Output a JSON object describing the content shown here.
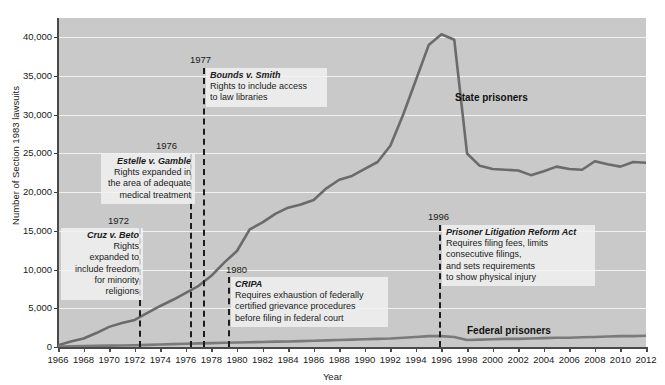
{
  "chart_data": {
    "type": "line",
    "title": "",
    "xlabel": "Year",
    "ylabel": "Number of Section 1983 lawsuits",
    "xlim": [
      1966,
      2012
    ],
    "ylim": [
      0,
      42500
    ],
    "grid": true,
    "legend_position": "inline-annotations",
    "y_ticks": [
      0,
      5000,
      10000,
      15000,
      20000,
      25000,
      30000,
      35000,
      40000
    ],
    "y_tick_labels": [
      "0",
      "5,000",
      "10,000",
      "15,000",
      "20,000",
      "25,000",
      "30,000",
      "35,000",
      "40,000"
    ],
    "x_ticks": [
      1966,
      1968,
      1970,
      1972,
      1974,
      1976,
      1978,
      1980,
      1982,
      1984,
      1986,
      1988,
      1990,
      1992,
      1994,
      1996,
      1998,
      2000,
      2002,
      2004,
      2006,
      2008,
      2010,
      2012
    ],
    "x_tick_labels": [
      "1966",
      "1968",
      "1970",
      "1972",
      "1974",
      "1976",
      "1978",
      "1980",
      "1982",
      "1984",
      "1986",
      "1988",
      "1990",
      "1992",
      "1994",
      "1996",
      "1998",
      "2000",
      "2002",
      "2004",
      "2006",
      "2008",
      "2010",
      "2012"
    ],
    "x": [
      1966,
      1967,
      1968,
      1969,
      1970,
      1971,
      1972,
      1973,
      1974,
      1975,
      1976,
      1977,
      1978,
      1979,
      1980,
      1981,
      1982,
      1983,
      1984,
      1985,
      1986,
      1987,
      1988,
      1989,
      1990,
      1991,
      1992,
      1993,
      1994,
      1995,
      1996,
      1997,
      1998,
      1999,
      2000,
      2001,
      2002,
      2003,
      2004,
      2005,
      2006,
      2007,
      2008,
      2009,
      2010,
      2011,
      2012
    ],
    "series": [
      {
        "name": "State prisoners",
        "color": "#6b6b6b",
        "values": [
          220,
          700,
          1100,
          1800,
          2600,
          3100,
          3500,
          4400,
          5300,
          6100,
          7000,
          7900,
          9200,
          10900,
          12400,
          15200,
          16100,
          17200,
          18000,
          18400,
          19000,
          20500,
          21600,
          22100,
          23000,
          23900,
          26000,
          30000,
          34500,
          39000,
          40400,
          39700,
          25000,
          23400,
          23000,
          22900,
          22800,
          22200,
          22700,
          23300,
          23000,
          22900,
          24000,
          23600,
          23300,
          23900,
          23800
        ]
      },
      {
        "name": "Federal prisoners",
        "color": "#7a7a7a",
        "values": [
          60,
          80,
          110,
          140,
          180,
          200,
          230,
          280,
          330,
          370,
          420,
          470,
          500,
          540,
          580,
          620,
          650,
          690,
          720,
          760,
          800,
          850,
          900,
          950,
          1000,
          1050,
          1100,
          1200,
          1300,
          1400,
          1400,
          1300,
          900,
          950,
          1000,
          1050,
          1050,
          1100,
          1150,
          1200,
          1200,
          1250,
          1300,
          1350,
          1400,
          1400,
          1450
        ]
      }
    ],
    "series_labels": [
      {
        "name": "state-prisoners-label",
        "text": "State prisoners",
        "x_px": 455,
        "y_px": 92
      },
      {
        "name": "federal-prisoners-label",
        "text": "Federal prisoners",
        "x_px": 467,
        "y_px": 325
      }
    ],
    "annotations": [
      {
        "id": "cruz-v-beto",
        "year": "1972",
        "title": "Cruz v. Beto",
        "desc": "Rights\nexpanded to\ninclude freedom\nfor minority\nreligions",
        "line_x_px": 139,
        "line_top_px": 228,
        "line_bottom_px": 347,
        "year_x_px": 108,
        "year_y_px": 215,
        "box_x_px": 61,
        "box_y_px": 228,
        "box_w_px": 74,
        "align": "right"
      },
      {
        "id": "estelle-v-gamble",
        "year": "1976",
        "title": "Estelle v. Gamble",
        "desc": "Rights expanded in\nthe area of adequate\nmedical treatment",
        "line_x_px": 190,
        "line_top_px": 154,
        "line_bottom_px": 347,
        "year_x_px": 156,
        "year_y_px": 140,
        "box_x_px": 101,
        "box_y_px": 154,
        "box_w_px": 86,
        "align": "right"
      },
      {
        "id": "bounds-v-smith",
        "year": "1977",
        "title": "Bounds v. Smith",
        "desc": "Rights to include access\nto law libraries",
        "line_x_px": 203,
        "line_top_px": 68,
        "line_bottom_px": 347,
        "year_x_px": 190,
        "year_y_px": 54,
        "box_x_px": 206,
        "box_y_px": 68,
        "box_w_px": 113,
        "align": "left"
      },
      {
        "id": "cripa",
        "year": "1980",
        "title": "CRIPA",
        "desc": "Requires exhaustion of federally\ncertified grievance procedures\nbefore filing in federal court",
        "line_x_px": 228,
        "line_top_px": 277,
        "line_bottom_px": 347,
        "year_x_px": 226,
        "year_y_px": 264,
        "box_x_px": 231,
        "box_y_px": 277,
        "box_w_px": 149,
        "align": "left"
      },
      {
        "id": "prisoner-litigation-reform-act",
        "year": "1996",
        "title": "Prisoner Litigation Reform Act",
        "desc": "Requires filing fees, limits\nconsecutive filings,\nand sets requirements\nto show physical injury",
        "line_x_px": 439,
        "line_top_px": 225,
        "line_bottom_px": 347,
        "year_x_px": 428,
        "year_y_px": 211,
        "box_x_px": 442,
        "box_y_px": 225,
        "box_w_px": 145,
        "align": "left"
      }
    ]
  }
}
